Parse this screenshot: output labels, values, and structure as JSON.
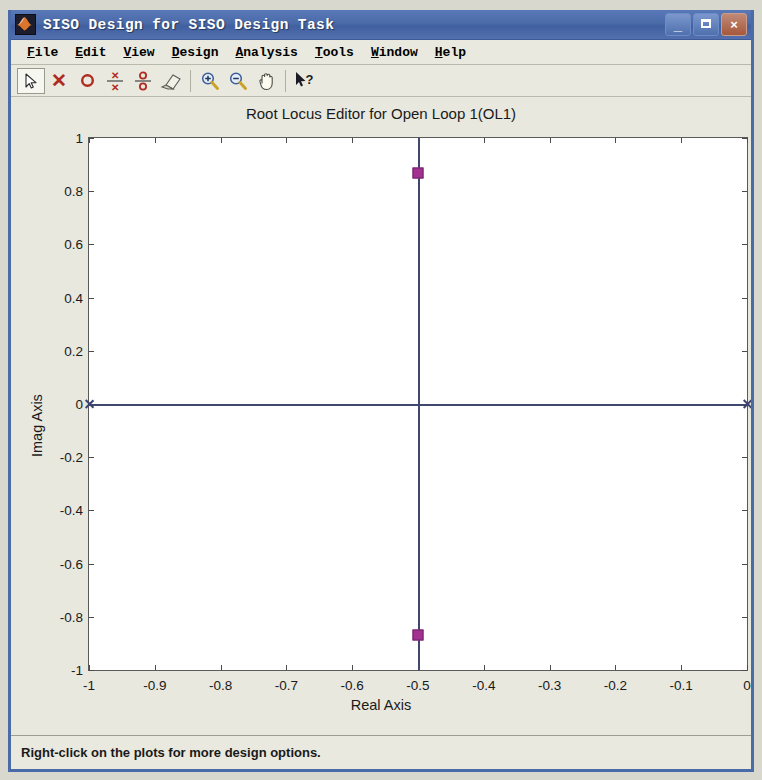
{
  "window": {
    "title": "SISO Design for SISO Design Task",
    "icon": "matlab-icon",
    "minimize_label": "_",
    "maximize_label": "□",
    "close_label": "×"
  },
  "menubar": {
    "items": [
      {
        "label": "File",
        "mnemonic": "F",
        "name": "menu-file"
      },
      {
        "label": "Edit",
        "mnemonic": "E",
        "name": "menu-edit"
      },
      {
        "label": "View",
        "mnemonic": "V",
        "name": "menu-view"
      },
      {
        "label": "Design",
        "mnemonic": "D",
        "name": "menu-design"
      },
      {
        "label": "Analysis",
        "mnemonic": "A",
        "name": "menu-analysis"
      },
      {
        "label": "Tools",
        "mnemonic": "T",
        "name": "menu-tools"
      },
      {
        "label": "Window",
        "mnemonic": "W",
        "name": "menu-window"
      },
      {
        "label": "Help",
        "mnemonic": "H",
        "name": "menu-help"
      }
    ]
  },
  "toolbar": {
    "items": [
      {
        "name": "pointer-arrow-icon",
        "glyph": "arrow",
        "selected": true
      },
      {
        "name": "add-real-pole-icon",
        "glyph": "x",
        "selected": false
      },
      {
        "name": "add-real-zero-icon",
        "glyph": "o",
        "selected": false
      },
      {
        "name": "add-complex-pole-icon",
        "glyph": "x-over-x",
        "selected": false
      },
      {
        "name": "add-complex-zero-icon",
        "glyph": "o-over-o",
        "selected": false
      },
      {
        "name": "delete-eraser-icon",
        "glyph": "eraser",
        "selected": false
      },
      {
        "name": "separator",
        "glyph": "sep",
        "selected": false
      },
      {
        "name": "zoom-in-icon",
        "glyph": "zoom-in",
        "selected": false
      },
      {
        "name": "zoom-out-icon",
        "glyph": "zoom-out",
        "selected": false
      },
      {
        "name": "pan-hand-icon",
        "glyph": "hand",
        "selected": false
      },
      {
        "name": "separator",
        "glyph": "sep",
        "selected": false
      },
      {
        "name": "context-help-icon",
        "glyph": "help",
        "selected": false
      }
    ]
  },
  "statusbar": {
    "message": "Right-click on the plots for more design options."
  },
  "chart_data": {
    "type": "scatter",
    "title": "Root Locus Editor for Open Loop 1(OL1)",
    "xlabel": "Real Axis",
    "ylabel": "Imag Axis",
    "xlim": [
      -1,
      0
    ],
    "ylim": [
      -1,
      1
    ],
    "grid": false,
    "legend": null,
    "xticks": [
      -1,
      -0.9,
      -0.8,
      -0.7,
      -0.6,
      -0.5,
      -0.4,
      -0.3,
      -0.2,
      -0.1,
      0
    ],
    "xticklabels": [
      "-1",
      "-0.9",
      "-0.8",
      "-0.7",
      "-0.6",
      "-0.5",
      "-0.4",
      "-0.3",
      "-0.2",
      "-0.1",
      "0"
    ],
    "yticks": [
      1,
      0.8,
      0.6,
      0.4,
      0.2,
      0,
      -0.2,
      -0.4,
      -0.6,
      -0.8,
      -1
    ],
    "yticklabels": [
      "1",
      "0.8",
      "0.6",
      "0.4",
      "0.2",
      "0",
      "-0.2",
      "-0.4",
      "-0.6",
      "-0.8",
      "-1"
    ],
    "series": [
      {
        "name": "root-locus-branch-real",
        "kind": "line",
        "color": "#41486e",
        "orientation": "horizontal",
        "y": 0,
        "x_from": -1,
        "x_to": 0
      },
      {
        "name": "root-locus-branch-vertical",
        "kind": "line",
        "color": "#41486e",
        "orientation": "vertical",
        "x": -0.5,
        "y_from": -1,
        "y_to": 1
      },
      {
        "name": "open-loop-poles",
        "kind": "marker",
        "marker": "x",
        "color": "#3b4270",
        "points": [
          {
            "x": -1,
            "y": 0
          },
          {
            "x": 0,
            "y": 0
          }
        ]
      },
      {
        "name": "closed-loop-poles",
        "kind": "marker",
        "marker": "square",
        "color": "#a33191",
        "points": [
          {
            "x": -0.5,
            "y": 0.87
          },
          {
            "x": -0.5,
            "y": -0.87
          }
        ]
      }
    ]
  }
}
